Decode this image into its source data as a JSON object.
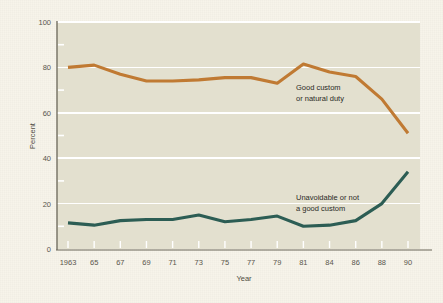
{
  "chart_data": {
    "type": "line",
    "title": "",
    "xlabel": "Year",
    "ylabel": "Percent",
    "ylim": [
      0,
      100
    ],
    "yticks": [
      0,
      20,
      40,
      60,
      80,
      100
    ],
    "yticklabels": [
      "0",
      "20",
      "40",
      "60",
      "80",
      "100"
    ],
    "yminorticks": [
      10,
      30,
      50,
      70,
      90
    ],
    "grid": "horizontal-white-at-major",
    "legend": "inline-annotations",
    "categories": [
      "1963",
      "65",
      "67",
      "69",
      "71",
      "73",
      "75",
      "77",
      "79",
      "81",
      "84",
      "86",
      "88",
      "90"
    ],
    "x": [
      "1963",
      "65",
      "67",
      "69",
      "71",
      "73",
      "75",
      "77",
      "79",
      "81",
      "84",
      "86",
      "88",
      "90"
    ],
    "series": [
      {
        "name": "Good custom or natural duty",
        "color": "#c07a33",
        "values": [
          80,
          81,
          77,
          74,
          74,
          74.5,
          75.5,
          75.5,
          73,
          81.5,
          78,
          76,
          66,
          51
        ]
      },
      {
        "name": "Unavoidable or not a good custom",
        "color": "#2c5d54",
        "values": [
          11.5,
          10.5,
          12.5,
          13,
          13,
          15,
          12,
          13,
          14.5,
          10,
          10.5,
          12.5,
          20,
          34
        ]
      }
    ],
    "annotations": [
      {
        "id": "orange-annot",
        "lines": [
          "Good custom",
          "or natural duty"
        ],
        "x_px": 296,
        "y_px": 90
      },
      {
        "id": "teal-annot",
        "lines": [
          "Unavoidable or not",
          "a good custom"
        ],
        "x_px": 296,
        "y_px": 200
      }
    ],
    "colors": {
      "page_background": "#f7f4ea",
      "plot_background": "#e3e0cf",
      "gridline": "#ffffff",
      "axis": "#6a6658",
      "series_1": "#c07a33",
      "series_2": "#2c5d54",
      "text": "#4e4b42"
    }
  }
}
